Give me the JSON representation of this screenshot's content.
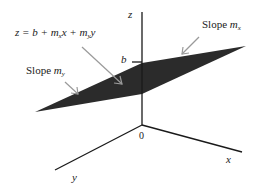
{
  "diagram": {
    "equation": {
      "prefix": "z = b + m",
      "sub1": "x",
      "mid": "x + m",
      "sub2": "y",
      "suffix": "y"
    },
    "slope_x": {
      "text": "Slope ",
      "var": "m",
      "sub": "x"
    },
    "slope_y": {
      "text": "Slope ",
      "var": "m",
      "sub": "y"
    },
    "intercept_label": "b",
    "axes": {
      "z": "z",
      "x": "x",
      "y": "y",
      "origin": "0"
    },
    "colors": {
      "plane": "#2a2a2a",
      "axis": "#1a1a1a",
      "arrow": "#9a9a9a"
    }
  }
}
